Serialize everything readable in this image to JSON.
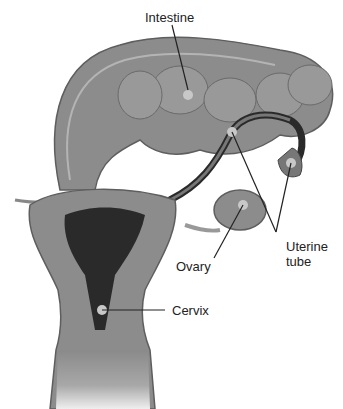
{
  "diagram": {
    "labels": {
      "intestine": "Intestine",
      "uterine_tube_line1": "Uterine",
      "uterine_tube_line2": "tube",
      "ovary": "Ovary",
      "cervix": "Cervix"
    },
    "colors": {
      "tissue": "#8c8c8c",
      "tissue_light": "#b4b4b4",
      "tissue_dark": "#5e5e5e",
      "cavity": "#2a2a2a",
      "marker": "#c8c8c8",
      "leader_line": "#222222"
    }
  }
}
